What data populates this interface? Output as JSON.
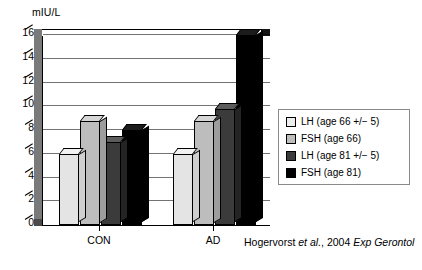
{
  "chart_data": {
    "type": "bar",
    "title": "",
    "subtitle": "",
    "xlabel": "",
    "ylabel": "mIU/L",
    "categories": [
      "CON",
      "AD"
    ],
    "ylim": [
      0,
      16
    ],
    "yticks": [
      0,
      2,
      4,
      6,
      8,
      10,
      12,
      14,
      16
    ],
    "ytick_labels": [
      "0",
      "2",
      "4",
      "6",
      "8",
      "10",
      "12",
      "14",
      "16"
    ],
    "grid": true,
    "legend_position": "right",
    "style": "3d-column",
    "series": [
      {
        "name": "LH (age 66 +/− 5)",
        "values": [
          6.0,
          6.0
        ],
        "color": "#ededed"
      },
      {
        "name": "FSH (age 66)",
        "values": [
          8.8,
          8.8
        ],
        "color": "#bdbdbd"
      },
      {
        "name": "LH (age 81 +/− 5)",
        "values": [
          7.0,
          9.8
        ],
        "color": "#3b3b3b"
      },
      {
        "name": "FSH (age 81)",
        "values": [
          8.0,
          16.0
        ],
        "color": "#000000"
      }
    ],
    "annotations": [
      {
        "name": "citation",
        "text_plain": "Hogervorst et al., 2004 Exp Gerontol"
      }
    ]
  },
  "citation": {
    "author": "Hogervorst ",
    "etal": "et al.",
    "year": ", 2004 ",
    "journal": "Exp Gerontol"
  },
  "legend": {
    "items": [
      {
        "label": "LH (age 66 +/− 5)",
        "swatch": "legend-swatch-lh-66"
      },
      {
        "label": "FSH (age 66)",
        "swatch": "legend-swatch-fsh-66"
      },
      {
        "label": "LH (age 81 +/− 5)",
        "swatch": "legend-swatch-lh-81"
      },
      {
        "label": "FSH (age 81)",
        "swatch": "legend-swatch-fsh-81"
      }
    ]
  }
}
